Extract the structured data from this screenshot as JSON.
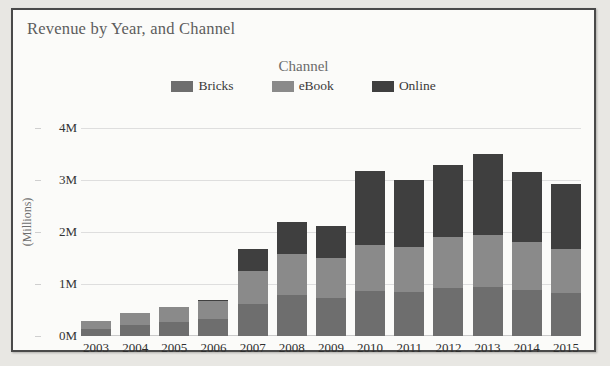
{
  "card": {
    "title": "Revenue by Year, and Channel"
  },
  "legend": {
    "title": "Channel",
    "items": [
      {
        "label": "Bricks",
        "color": "#6e6e6e"
      },
      {
        "label": "eBook",
        "color": "#8a8a8a"
      },
      {
        "label": "Online",
        "color": "#3f3f3f"
      }
    ]
  },
  "axes": {
    "ylabel": "(Millions)",
    "yticks": [
      "0M",
      "1M",
      "2M",
      "3M",
      "4M"
    ],
    "ytick_values": [
      0,
      1,
      2,
      3,
      4
    ]
  },
  "chart_data": {
    "type": "bar",
    "title": "Revenue by Year, and Channel",
    "stacked": true,
    "legend_title": "Channel",
    "legend_position": "top",
    "grid": true,
    "xlabel": "",
    "ylabel": "(Millions)",
    "ylim": [
      0,
      4
    ],
    "ytick_labels": [
      "0M",
      "1M",
      "2M",
      "3M",
      "4M"
    ],
    "categories": [
      "2003",
      "2004",
      "2005",
      "2006",
      "2007",
      "2008",
      "2009",
      "2010",
      "2011",
      "2012",
      "2013",
      "2014",
      "2015"
    ],
    "series": [
      {
        "name": "Bricks",
        "color": "#6e6e6e",
        "values": [
          0.14,
          0.22,
          0.27,
          0.32,
          0.62,
          0.78,
          0.74,
          0.86,
          0.84,
          0.92,
          0.95,
          0.88,
          0.82
        ]
      },
      {
        "name": "eBook",
        "color": "#8a8a8a",
        "values": [
          0.14,
          0.22,
          0.29,
          0.35,
          0.63,
          0.8,
          0.76,
          0.89,
          0.87,
          0.98,
          1.0,
          0.92,
          0.86
        ]
      },
      {
        "name": "Online",
        "color": "#3f3f3f",
        "values": [
          0.0,
          0.0,
          0.0,
          0.03,
          0.43,
          0.62,
          0.62,
          1.42,
          1.29,
          1.38,
          1.55,
          1.35,
          1.24
        ]
      }
    ],
    "totals": [
      0.28,
      0.44,
      0.56,
      0.7,
      1.68,
      2.2,
      2.12,
      3.17,
      3.0,
      3.28,
      3.5,
      3.15,
      2.92
    ]
  }
}
